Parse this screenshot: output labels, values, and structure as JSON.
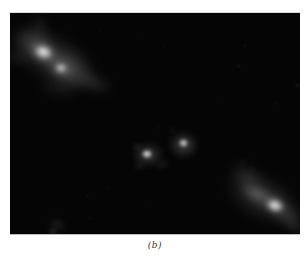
{
  "caption": {
    "label": "(b)"
  },
  "figure": {
    "colors": {
      "page_background": "#ffffff",
      "sky_background": "#050505",
      "core_white": "#ffffff",
      "nebulosity_gray": "#8d8d8d",
      "caption_text": "#333333"
    },
    "blobs": [
      {
        "name": "tl-cloud-main",
        "x": 45,
        "y": 46,
        "w": 100,
        "h": 50,
        "rot": 30,
        "color": "#8d8d8d",
        "a": 0.35,
        "blur": 5
      },
      {
        "name": "tl-cloud-upper",
        "x": 24,
        "y": 30,
        "w": 48,
        "h": 34,
        "rot": 25,
        "color": "#969696",
        "a": 0.32,
        "blur": 4
      },
      {
        "name": "tl-cloud-mid",
        "x": 58,
        "y": 57,
        "w": 56,
        "h": 38,
        "rot": 30,
        "color": "#909090",
        "a": 0.38,
        "blur": 4
      },
      {
        "name": "tl-cloud-right-tendril",
        "x": 84,
        "y": 70,
        "w": 40,
        "h": 20,
        "rot": 20,
        "color": "#787878",
        "a": 0.3,
        "blur": 4
      },
      {
        "name": "tl-wisp-top",
        "x": 30,
        "y": 12,
        "w": 26,
        "h": 15,
        "rot": 60,
        "color": "#6a6a6a",
        "a": 0.25,
        "blur": 4
      },
      {
        "name": "tl-wisp-left",
        "x": 7,
        "y": 45,
        "w": 28,
        "h": 14,
        "rot": 10,
        "color": "#6a6a6a",
        "a": 0.25,
        "blur": 4
      },
      {
        "name": "tl-cloud-lower",
        "x": 47,
        "y": 76,
        "w": 44,
        "h": 16,
        "rot": 15,
        "color": "#5f5f5f",
        "a": 0.25,
        "blur": 4
      },
      {
        "name": "tl-core-halo",
        "x": 33,
        "y": 39,
        "w": 32,
        "h": 23,
        "rot": 25,
        "color": "#cfcfcf",
        "a": 0.5,
        "blur": 3
      },
      {
        "name": "tl-core",
        "x": 33,
        "y": 39,
        "w": 19,
        "h": 14,
        "rot": 20,
        "color": "#ffffff",
        "a": 0.97,
        "blur": 2
      },
      {
        "name": "tl-secondary-halo",
        "x": 51,
        "y": 55,
        "w": 24,
        "h": 18,
        "rot": 25,
        "color": "#bdbdbd",
        "a": 0.45,
        "blur": 3
      },
      {
        "name": "tl-secondary-core",
        "x": 51,
        "y": 55,
        "w": 12,
        "h": 10,
        "rot": 0,
        "color": "#ededed",
        "a": 0.85,
        "blur": 2
      },
      {
        "name": "center-left-halo",
        "x": 138,
        "y": 141,
        "w": 32,
        "h": 25,
        "rot": 0,
        "color": "#9a9a9a",
        "a": 0.42,
        "blur": 3
      },
      {
        "name": "center-left-speck-a",
        "x": 126,
        "y": 133,
        "w": 9,
        "h": 7,
        "rot": 0,
        "color": "#7a7a7a",
        "a": 0.3,
        "blur": 2
      },
      {
        "name": "center-left-speck-b",
        "x": 129,
        "y": 153,
        "w": 11,
        "h": 6,
        "rot": -10,
        "color": "#7a7a7a",
        "a": 0.3,
        "blur": 2
      },
      {
        "name": "center-left-arc",
        "x": 152,
        "y": 151,
        "w": 18,
        "h": 7,
        "rot": -20,
        "color": "#6e6e6e",
        "a": 0.3,
        "blur": 2
      },
      {
        "name": "center-left-core",
        "x": 137,
        "y": 141,
        "w": 12,
        "h": 10,
        "rot": 0,
        "color": "#ffffff",
        "a": 0.95,
        "blur": 1.5
      },
      {
        "name": "center-right-halo",
        "x": 173,
        "y": 132,
        "w": 31,
        "h": 28,
        "rot": 0,
        "color": "#9a9a9a",
        "a": 0.42,
        "blur": 3
      },
      {
        "name": "center-right-core",
        "x": 173,
        "y": 130,
        "w": 11,
        "h": 10,
        "rot": 0,
        "color": "#f4f4f4",
        "a": 0.9,
        "blur": 1.5
      },
      {
        "name": "center-speck-c",
        "x": 162,
        "y": 117,
        "w": 6,
        "h": 5,
        "rot": 0,
        "color": "#888888",
        "a": 0.3,
        "blur": 2
      },
      {
        "name": "center-speck-d",
        "x": 148,
        "y": 114,
        "w": 5,
        "h": 4,
        "rot": 0,
        "color": "#777777",
        "a": 0.25,
        "blur": 2
      },
      {
        "name": "br-cloud-main",
        "x": 253,
        "y": 185,
        "w": 82,
        "h": 46,
        "rot": 25,
        "color": "#8d8d8d",
        "a": 0.35,
        "blur": 5
      },
      {
        "name": "br-cloud-upper",
        "x": 237,
        "y": 164,
        "w": 42,
        "h": 26,
        "rot": 30,
        "color": "#787878",
        "a": 0.3,
        "blur": 4
      },
      {
        "name": "br-inner-bar",
        "x": 247,
        "y": 181,
        "w": 38,
        "h": 18,
        "rot": 25,
        "color": "#ababab",
        "a": 0.42,
        "blur": 3
      },
      {
        "name": "br-cloud-lower",
        "x": 278,
        "y": 203,
        "w": 38,
        "h": 24,
        "rot": 25,
        "color": "#8a8a8a",
        "a": 0.33,
        "blur": 4
      },
      {
        "name": "br-core-halo",
        "x": 265,
        "y": 192,
        "w": 28,
        "h": 20,
        "rot": 20,
        "color": "#cfcfcf",
        "a": 0.5,
        "blur": 3
      },
      {
        "name": "br-core",
        "x": 265,
        "y": 192,
        "w": 18,
        "h": 13,
        "rot": 20,
        "color": "#ffffff",
        "a": 0.97,
        "blur": 2
      },
      {
        "name": "br-speck-a",
        "x": 233,
        "y": 149,
        "w": 6,
        "h": 5,
        "rot": 0,
        "color": "#6a6a6a",
        "a": 0.28,
        "blur": 2
      },
      {
        "name": "br-speck-b",
        "x": 242,
        "y": 156,
        "w": 5,
        "h": 4,
        "rot": 0,
        "color": "#6a6a6a",
        "a": 0.24,
        "blur": 2
      },
      {
        "name": "br-tendril-edge",
        "x": 284,
        "y": 213,
        "w": 26,
        "h": 13,
        "rot": 30,
        "color": "#6a6a6a",
        "a": 0.26,
        "blur": 3
      },
      {
        "name": "field-speckle",
        "x": 153,
        "y": 33,
        "w": 4,
        "h": 3,
        "rot": 0,
        "color": "#888888",
        "a": 0.16,
        "blur": 1
      },
      {
        "name": "field-speckle",
        "x": 235,
        "y": 32,
        "w": 4,
        "h": 3,
        "rot": 0,
        "color": "#888888",
        "a": 0.18,
        "blur": 1
      },
      {
        "name": "field-speckle",
        "x": 228,
        "y": 53,
        "w": 5,
        "h": 4,
        "rot": 0,
        "color": "#888888",
        "a": 0.2,
        "blur": 1
      },
      {
        "name": "field-speckle",
        "x": 287,
        "y": 72,
        "w": 5,
        "h": 4,
        "rot": 0,
        "color": "#999999",
        "a": 0.28,
        "blur": 1
      },
      {
        "name": "field-speckle",
        "x": 265,
        "y": 90,
        "w": 4,
        "h": 3,
        "rot": 0,
        "color": "#888888",
        "a": 0.18,
        "blur": 1
      },
      {
        "name": "field-speckle",
        "x": 208,
        "y": 83,
        "w": 3,
        "h": 3,
        "rot": 0,
        "color": "#888888",
        "a": 0.14,
        "blur": 1
      },
      {
        "name": "field-speckle",
        "x": 130,
        "y": 24,
        "w": 3,
        "h": 3,
        "rot": 0,
        "color": "#888888",
        "a": 0.14,
        "blur": 1
      },
      {
        "name": "field-speckle",
        "x": 90,
        "y": 17,
        "w": 4,
        "h": 3,
        "rot": 0,
        "color": "#888888",
        "a": 0.14,
        "blur": 1
      },
      {
        "name": "field-speckle",
        "x": 77,
        "y": 183,
        "w": 4,
        "h": 4,
        "rot": 0,
        "color": "#888888",
        "a": 0.2,
        "blur": 1
      },
      {
        "name": "field-speckle",
        "x": 98,
        "y": 175,
        "w": 3,
        "h": 3,
        "rot": 0,
        "color": "#888888",
        "a": 0.16,
        "blur": 1
      },
      {
        "name": "field-speckle",
        "x": 140,
        "y": 192,
        "w": 3,
        "h": 3,
        "rot": 0,
        "color": "#888888",
        "a": 0.14,
        "blur": 1
      },
      {
        "name": "field-speckle",
        "x": 80,
        "y": 205,
        "w": 4,
        "h": 3,
        "rot": 0,
        "color": "#888888",
        "a": 0.18,
        "blur": 1
      },
      {
        "name": "bottom-smudge",
        "x": 47,
        "y": 212,
        "w": 16,
        "h": 12,
        "rot": 20,
        "color": "#8a8a8a",
        "a": 0.28,
        "blur": 3
      },
      {
        "name": "bottom-bright-dot",
        "x": 42,
        "y": 218,
        "w": 7,
        "h": 5,
        "rot": 0,
        "color": "#bbbbbb",
        "a": 0.5,
        "blur": 2
      }
    ]
  }
}
